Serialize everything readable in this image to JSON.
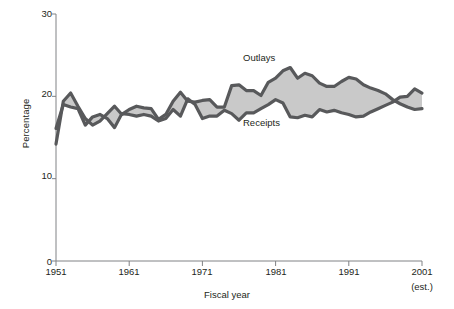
{
  "chart_data": {
    "type": "line",
    "title": "",
    "xlabel": "Fiscal year",
    "ylabel": "Percentage",
    "xlim": [
      1951,
      2001
    ],
    "ylim": [
      0,
      30
    ],
    "grid": false,
    "legend_position": "inline-annotations",
    "xticks": [
      1951,
      1961,
      1971,
      1981,
      1991,
      2001
    ],
    "xtick_labels": [
      "1951",
      "1961",
      "1971",
      "1981",
      "1991",
      "2001"
    ],
    "xtick_sublabel_last": "(est.)",
    "yticks": [
      0,
      10,
      20,
      30
    ],
    "ytick_labels": [
      "0",
      "10",
      "20",
      "30"
    ],
    "fill_label": "Deficit",
    "fill_color": "#c9c9c9",
    "line_color": "#58595b",
    "x": [
      1951,
      1952,
      1953,
      1954,
      1955,
      1956,
      1957,
      1958,
      1959,
      1960,
      1961,
      1962,
      1963,
      1964,
      1965,
      1966,
      1967,
      1968,
      1969,
      1970,
      1971,
      1972,
      1973,
      1974,
      1975,
      1976,
      1977,
      1978,
      1979,
      1980,
      1981,
      1982,
      1983,
      1984,
      1985,
      1986,
      1987,
      1988,
      1989,
      1990,
      1991,
      1992,
      1993,
      1994,
      1995,
      1996,
      1997,
      1998,
      1999,
      2000,
      2001
    ],
    "series": [
      {
        "name": "Outlays",
        "values": [
          14.2,
          19.4,
          20.4,
          18.8,
          17.3,
          16.5,
          17.0,
          17.9,
          18.8,
          17.8,
          18.4,
          18.8,
          18.6,
          18.5,
          17.2,
          17.8,
          19.4,
          20.5,
          19.4,
          19.3,
          19.5,
          19.6,
          18.7,
          18.7,
          21.3,
          21.4,
          20.7,
          20.7,
          20.1,
          21.7,
          22.2,
          23.1,
          23.5,
          22.2,
          22.8,
          22.5,
          21.6,
          21.2,
          21.2,
          21.8,
          22.3,
          22.1,
          21.4,
          21.0,
          20.7,
          20.3,
          19.6,
          19.1,
          18.7,
          18.4,
          18.5
        ]
      },
      {
        "name": "Receipts",
        "values": [
          16.1,
          19.0,
          18.7,
          18.5,
          16.5,
          17.5,
          17.8,
          17.3,
          16.2,
          17.9,
          17.8,
          17.6,
          17.8,
          17.6,
          17.0,
          17.3,
          18.4,
          17.6,
          19.7,
          19.0,
          17.3,
          17.6,
          17.6,
          18.3,
          17.9,
          17.1,
          18.0,
          18.0,
          18.5,
          19.0,
          19.6,
          19.2,
          17.5,
          17.4,
          17.7,
          17.5,
          18.4,
          18.1,
          18.3,
          18.0,
          17.8,
          17.5,
          17.6,
          18.1,
          18.5,
          18.9,
          19.3,
          19.9,
          20.0,
          20.9,
          20.4
        ]
      }
    ],
    "annotations": [
      {
        "text": "Outlays",
        "x": 1977,
        "y": 25.2
      },
      {
        "text": "Deficit",
        "x": 1985,
        "y": 22.0
      },
      {
        "text": "Receipts",
        "x": 1977,
        "y": 14.6
      }
    ]
  }
}
